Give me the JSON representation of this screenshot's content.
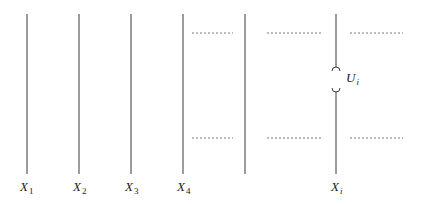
{
  "diagram": {
    "type": "variable-lines-with-unobserved-factor",
    "line_color": "#3a3a3a",
    "dash_color": "#555555",
    "variables": [
      {
        "name": "X",
        "subscript": "1",
        "x": 27
      },
      {
        "name": "X",
        "subscript": "2",
        "x": 79
      },
      {
        "name": "X",
        "subscript": "3",
        "x": 131
      },
      {
        "name": "X",
        "subscript": "4",
        "x": 183
      },
      {
        "name": "",
        "subscript": "",
        "x": 245
      },
      {
        "name": "X",
        "subscript": "i",
        "x": 336
      }
    ],
    "latent": {
      "name": "U",
      "subscript": "i",
      "attached_to": "X_i"
    },
    "dashed_rows": [
      33,
      138
    ],
    "dashed_segments": [
      [
        192,
        233
      ],
      [
        267,
        322
      ],
      [
        350,
        403
      ]
    ]
  },
  "labels": {
    "x1": {
      "main": "X",
      "sub": "1"
    },
    "x2": {
      "main": "X",
      "sub": "2"
    },
    "x3": {
      "main": "X",
      "sub": "3"
    },
    "x4": {
      "main": "X",
      "sub": "4"
    },
    "xi": {
      "main": "X",
      "sub": "i"
    },
    "ui": {
      "main": "U",
      "sub": "i"
    }
  }
}
